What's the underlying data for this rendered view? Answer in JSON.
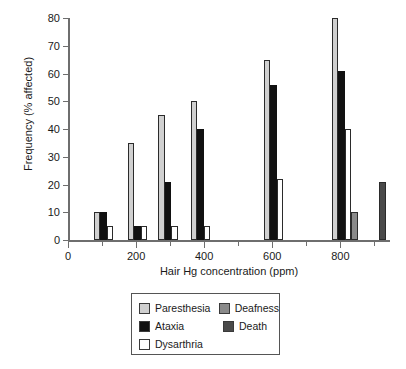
{
  "chart_data": {
    "type": "bar",
    "title": "",
    "xlabel": "Hair Hg concentration (ppm)",
    "ylabel": "Frequency (% affected)",
    "xlim": [
      0,
      940
    ],
    "ylim": [
      0,
      80
    ],
    "yticks": [
      0,
      10,
      20,
      30,
      40,
      50,
      60,
      70,
      80
    ],
    "xticks": [
      0,
      200,
      400,
      600,
      800
    ],
    "xticks_minor": [
      100,
      300,
      500,
      700,
      900
    ],
    "grid": false,
    "legend_position": "bottom-center",
    "series": [
      {
        "name": "Paresthesia",
        "color": "#d0d0d0",
        "points": [
          {
            "x": 75,
            "value": 10
          },
          {
            "x": 175,
            "value": 35
          },
          {
            "x": 265,
            "value": 45
          },
          {
            "x": 360,
            "value": 50
          },
          {
            "x": 575,
            "value": 65
          },
          {
            "x": 775,
            "value": 80
          }
        ]
      },
      {
        "name": "Ataxia",
        "color": "#111111",
        "points": [
          {
            "x": 75,
            "value": 10
          },
          {
            "x": 175,
            "value": 5
          },
          {
            "x": 265,
            "value": 21
          },
          {
            "x": 360,
            "value": 40
          },
          {
            "x": 575,
            "value": 56
          },
          {
            "x": 775,
            "value": 61
          }
        ]
      },
      {
        "name": "Dysarthria",
        "color": "#ffffff",
        "points": [
          {
            "x": 75,
            "value": 5
          },
          {
            "x": 175,
            "value": 5
          },
          {
            "x": 265,
            "value": 5
          },
          {
            "x": 360,
            "value": 5
          },
          {
            "x": 575,
            "value": 22
          },
          {
            "x": 775,
            "value": 40
          }
        ]
      },
      {
        "name": "Deafness",
        "color": "#8a8a8a",
        "points": [
          {
            "x": 775,
            "value": 10
          }
        ]
      },
      {
        "name": "Death",
        "color": "#4a4a4a",
        "points": [
          {
            "x": 915,
            "value": 21
          }
        ]
      }
    ],
    "legend": [
      {
        "label": "Paresthesia",
        "color": "#d0d0d0"
      },
      {
        "label": "Deafness",
        "color": "#8a8a8a"
      },
      {
        "label": "Ataxia",
        "color": "#111111"
      },
      {
        "label": "Death",
        "color": "#4a4a4a"
      },
      {
        "label": "Dysarthria",
        "color": "#ffffff"
      }
    ]
  },
  "legend_labels": {
    "paresthesia": "Paresthesia",
    "deafness": "Deafness",
    "ataxia": "Ataxia",
    "death": "Death",
    "dysarthria": "Dysarthria"
  },
  "axes": {
    "x_title": "Hair Hg concentration (ppm)",
    "y_title": "Frequency (% affected)"
  }
}
